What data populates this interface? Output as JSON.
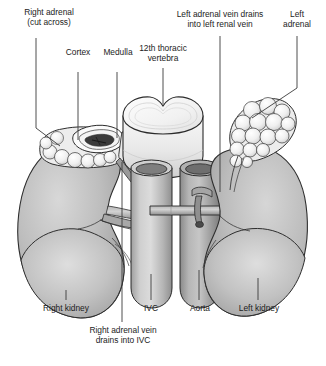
{
  "figure": {
    "background_color": "#ffffff",
    "text_color": "#1c1c1c",
    "leader_line_color": "#3a3a3a",
    "outline_color": "#2b2b2b"
  },
  "labels": {
    "right_adrenal": "Right adrenal\n(cut across)",
    "cortex": "Cortex",
    "medulla": "Medulla",
    "vertebra": "12th thoracic\nvertebra",
    "left_adrenal_vein": "Left adrenal vein drains\ninto left renal vein",
    "left_adrenal": "Left\nadrenal",
    "right_kidney": "Right kidney",
    "ivc": "IVC",
    "aorta": "Aorta",
    "left_kidney": "Left kidney",
    "right_adrenal_vein": "Right adrenal vein\ndrains into IVC"
  },
  "structures": {
    "right_kidney": {
      "name": "Right kidney",
      "fill": "#b4b4b4"
    },
    "left_kidney": {
      "name": "Left kidney",
      "fill": "#b4b4b4"
    },
    "right_adrenal_cut": {
      "name": "Right adrenal gland (cut across)",
      "fill": "#f0f0f0"
    },
    "left_adrenal": {
      "name": "Left adrenal gland",
      "fill": "#ededed"
    },
    "vertebra": {
      "name": "12th thoracic vertebra",
      "fill": "#efefef"
    },
    "ivc": {
      "name": "Inferior vena cava",
      "fill": "#b9b9b9"
    },
    "aorta": {
      "name": "Aorta",
      "fill": "#9d9d9d"
    },
    "adrenal_cortex": {
      "name": "Adrenal cortex",
      "fill": "#fbfbfb"
    },
    "adrenal_medulla": {
      "name": "Adrenal medulla",
      "fill": "#3b3b3b"
    }
  }
}
